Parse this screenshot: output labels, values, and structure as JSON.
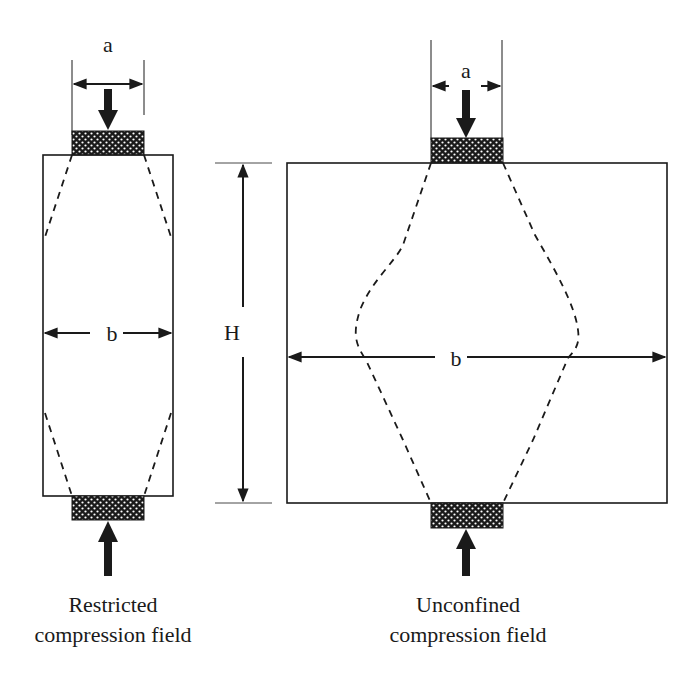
{
  "diagram": {
    "type": "structural-mechanics-schematic",
    "panels": [
      {
        "id": "restricted",
        "caption_line1": "Restricted",
        "caption_line2": "compression field",
        "dimension_a": "a",
        "dimension_b": "b"
      },
      {
        "id": "unconfined",
        "caption_line1": "Unconfined",
        "caption_line2": "compression field",
        "dimension_a": "a",
        "dimension_b": "b",
        "dimension_H": "H"
      }
    ],
    "colors": {
      "stroke": "#1a1a1a",
      "background": "#ffffff"
    }
  }
}
